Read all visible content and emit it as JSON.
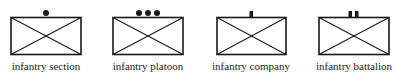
{
  "diagram": {
    "stroke_color": "#1a1a1a",
    "symbols": [
      {
        "label": "infantry section",
        "size_marker": "one-dot",
        "left": 0,
        "box_x": 11
      },
      {
        "label": "infantry platoon",
        "size_marker": "three-dots",
        "left": 100,
        "box_x": 13
      },
      {
        "label": "infantry company",
        "size_marker": "one-bar",
        "left": 200,
        "box_x": 17
      },
      {
        "label": "infantry battalion",
        "size_marker": "two-bars",
        "left": 300,
        "box_x": 19
      }
    ]
  }
}
